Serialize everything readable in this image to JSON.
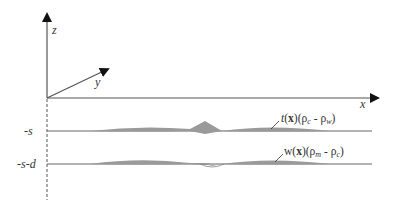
{
  "diagram": {
    "axes": {
      "z_label": "z",
      "y_label": "y",
      "x_label": "x"
    },
    "levels": {
      "surface1_label": "-s",
      "surface2_label": "-s-d"
    },
    "annotations": {
      "top_layer": {
        "func": "t",
        "arg": "x",
        "rho1": "ρ",
        "sub1": "c",
        "minus": " - ",
        "rho2": "ρ",
        "sub2": "w"
      },
      "bottom_layer": {
        "func": "w",
        "arg": "x",
        "rho1": "ρ",
        "sub1": "m",
        "minus": " - ",
        "rho2": "ρ",
        "sub2": "c"
      }
    },
    "colors": {
      "line": "#555555",
      "fill": "#9a9a9a",
      "text": "#333333"
    }
  }
}
